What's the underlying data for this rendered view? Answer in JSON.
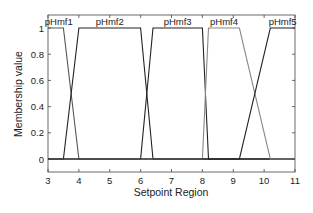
{
  "chart_data": {
    "type": "line",
    "title": "",
    "xlabel": "Setpoint Region",
    "ylabel": "Membership value",
    "xlim": [
      3,
      11
    ],
    "ylim": [
      -0.1,
      1.1
    ],
    "xticks": [
      3,
      4,
      5,
      6,
      7,
      8,
      9,
      10,
      11
    ],
    "yticks": [
      0,
      0.2,
      0.4,
      0.6,
      0.8,
      1
    ],
    "ytick_labels": [
      "0",
      "0.2",
      "0.4",
      "0.6",
      "0.8",
      "1"
    ],
    "grid": false,
    "legend": "none (labels placed above each membership function)",
    "series": [
      {
        "name": "pHmf1",
        "color": "#555555",
        "x": [
          3.0,
          3.5,
          4.0,
          11.0
        ],
        "y": [
          1,
          1,
          0,
          0
        ],
        "label_x": 3.35
      },
      {
        "name": "pHmf2",
        "color": "#222222",
        "x": [
          3.0,
          3.5,
          4.0,
          6.0,
          6.4,
          11.0
        ],
        "y": [
          0,
          0,
          1,
          1,
          0,
          0
        ],
        "label_x": 5.0
      },
      {
        "name": "pHmf3",
        "color": "#222222",
        "x": [
          3.0,
          6.0,
          6.4,
          8.0,
          8.2,
          11.0
        ],
        "y": [
          0,
          0,
          1,
          1,
          0,
          0
        ],
        "label_x": 7.2
      },
      {
        "name": "pHmf4",
        "color": "#888888",
        "x": [
          3.0,
          8.0,
          8.2,
          9.2,
          10.2,
          11.0
        ],
        "y": [
          0,
          0,
          1,
          1,
          0,
          0
        ],
        "label_x": 8.7
      },
      {
        "name": "pHmf5",
        "color": "#222222",
        "x": [
          3.0,
          9.2,
          10.2,
          11.0
        ],
        "y": [
          0,
          0,
          1,
          1
        ],
        "label_x": 10.6
      }
    ]
  }
}
